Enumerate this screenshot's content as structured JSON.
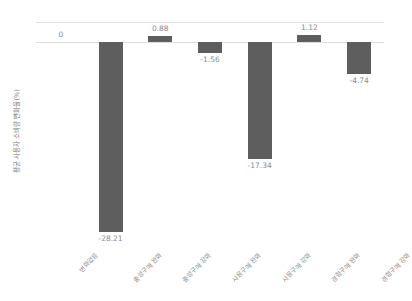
{
  "chart_data": {
    "type": "bar",
    "title": "",
    "xlabel": "",
    "ylabel": "평균 사용자 소비량 변화율(%)",
    "categories": [
      "변화없음",
      "충성구매 완화",
      "충성구매 강화",
      "사용구매 완화",
      "사용구매 강화",
      "경험구매 완화",
      "경험구매 강화"
    ],
    "values": [
      0,
      -28.21,
      0.88,
      -1.56,
      -17.34,
      1.12,
      -4.74
    ],
    "value_labels": [
      "0",
      "-28.21",
      "0.88",
      "-1.56",
      "-17.34",
      "1.12",
      "-4.74"
    ],
    "ylim": [
      -30,
      3
    ],
    "grid": false,
    "legend": "none",
    "bar_color": "#5e5e5e",
    "axis_line_color": "#e0e0e0",
    "text_color": "#8a8a8a"
  }
}
